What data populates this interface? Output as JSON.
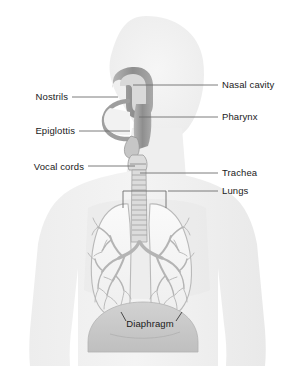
{
  "diagram": {
    "background_color": "#ffffff",
    "body_silhouette_color": "#f1f1f1",
    "body_silhouette_edge_color": "#e4e4e4",
    "airway_color": "#9a9a9a",
    "airway_dark_color": "#8a8a8a",
    "lung_fill_color": "#f6f6f6",
    "lung_outline_color": "#b9b9b9",
    "bronchi_color": "#b4b4b4",
    "diaphragm_color": "#c9c9c9",
    "leader_line_color": "#6e6e6e",
    "label_text_color": "#1a1a1a"
  },
  "labels": {
    "left": [
      {
        "id": "nostrils",
        "text": "Nostrils",
        "text_x": 68,
        "text_y": 100,
        "line_x1": 72,
        "line_y1": 97,
        "line_x2": 118,
        "line_y2": 97
      },
      {
        "id": "epiglottis",
        "text": "Epiglottis",
        "text_x": 75,
        "text_y": 134,
        "line_x1": 79,
        "line_y1": 131,
        "line_x2": 130,
        "line_y2": 131
      },
      {
        "id": "vocal-cords",
        "text": "Vocal cords",
        "text_x": 84,
        "text_y": 170,
        "line_x1": 88,
        "line_y1": 166,
        "line_x2": 135,
        "line_y2": 166
      }
    ],
    "right": [
      {
        "id": "nasal-cavity",
        "text": "Nasal cavity",
        "text_x": 222,
        "text_y": 88,
        "line_x1": 133,
        "line_y1": 85,
        "line_x2": 218,
        "line_y2": 85
      },
      {
        "id": "pharynx",
        "text": "Pharynx",
        "text_x": 222,
        "text_y": 120,
        "line_x1": 139,
        "line_y1": 117,
        "line_x2": 218,
        "line_y2": 117
      },
      {
        "id": "trachea",
        "text": "Trachea",
        "text_x": 222,
        "text_y": 176,
        "line_x1": 140,
        "line_y1": 173,
        "line_x2": 218,
        "line_y2": 173
      },
      {
        "id": "lungs",
        "text": "Lungs",
        "text_x": 222,
        "text_y": 194,
        "line_x1": 168,
        "line_y1": 191,
        "line_x2": 218,
        "line_y2": 191
      }
    ],
    "center": [
      {
        "id": "diaphragm",
        "text": "Diaphragm",
        "text_x": 146,
        "text_y": 327
      }
    ]
  },
  "lung_bracket": {
    "left_x": 123,
    "right_x": 166,
    "top_y": 191,
    "tick_bottom_y": 208
  },
  "diaphragm_ticks": [
    {
      "x1": 126,
      "y1": 321,
      "x2": 121,
      "y2": 312
    },
    {
      "x1": 176,
      "y1": 321,
      "x2": 182,
      "y2": 312
    }
  ]
}
